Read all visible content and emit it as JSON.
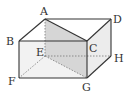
{
  "diagram": {
    "type": "cuboid",
    "vertices": {
      "A": {
        "label": "A",
        "x": 45,
        "y": 19
      },
      "B": {
        "label": "B",
        "x": 19,
        "y": 41
      },
      "C": {
        "label": "C",
        "x": 87,
        "y": 41
      },
      "D": {
        "label": "D",
        "x": 111,
        "y": 19
      },
      "E": {
        "label": "E",
        "x": 45,
        "y": 56
      },
      "F": {
        "label": "F",
        "x": 19,
        "y": 78
      },
      "G": {
        "label": "G",
        "x": 87,
        "y": 78
      },
      "H": {
        "label": "H",
        "x": 111,
        "y": 56
      }
    },
    "solid_edges": [
      "AB",
      "AD",
      "BC",
      "CD",
      "BF",
      "CG",
      "DH",
      "FG",
      "GH",
      "AC"
    ],
    "hidden_edges": [
      "AE",
      "EF",
      "EH",
      "EG"
    ],
    "shaded_section": [
      "A",
      "C",
      "G",
      "E"
    ],
    "colors": {
      "edge": "#333333",
      "hidden_edge": "#777777",
      "section_fill": "#d9d9d9",
      "face_fill": "#f0f0f0",
      "label": "#333333"
    }
  }
}
